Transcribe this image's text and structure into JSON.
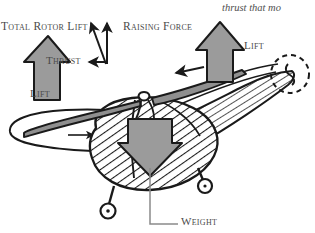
{
  "figure": {
    "background_color": "#ffffff",
    "width": 315,
    "height": 233
  },
  "running_text": {
    "top_right_clipped": "thrust that mo"
  },
  "labels": {
    "total_rotor_lift": "Total Rotor Lift",
    "raising_force": "Raising Force",
    "thrust": "Thrust",
    "lift_right": "Lift",
    "lift_left": "Lift",
    "weight": "Weight"
  },
  "colors": {
    "ink": "#1a1a1a",
    "label_text": "#4a4a4a",
    "block_arrow_fill": "#9b9b9b",
    "block_arrow_stroke": "#1a1a1a",
    "body_fill": "#ffffff",
    "hatch": "#1a1a1a",
    "leader_line": "#8a8a8a",
    "background": "#ffffff"
  },
  "force_vectors": [
    {
      "name": "total-rotor-lift",
      "direction": "up-left-diagonal",
      "style": "thin-line-arrow"
    },
    {
      "name": "raising-force",
      "direction": "up-vertical",
      "style": "thin-line-arrow"
    },
    {
      "name": "thrust",
      "direction": "left-horizontal",
      "style": "thin-line-arrow"
    }
  ],
  "block_arrows": [
    {
      "name": "lift-left",
      "direction": "up",
      "fill": "#9b9b9b"
    },
    {
      "name": "lift-right",
      "direction": "up",
      "fill": "#9b9b9b"
    },
    {
      "name": "weight",
      "direction": "down",
      "fill": "#9b9b9b"
    }
  ],
  "aircraft_parts": [
    "main-rotor-blade-left",
    "main-rotor-blade-right",
    "rotor-hub",
    "rotor-disc-ellipse",
    "rotation-direction-arrow",
    "fuselage",
    "tail-boom",
    "tail-rotor-dashed-circle",
    "landing-gear-wheel-front",
    "landing-gear-wheel-rear"
  ]
}
